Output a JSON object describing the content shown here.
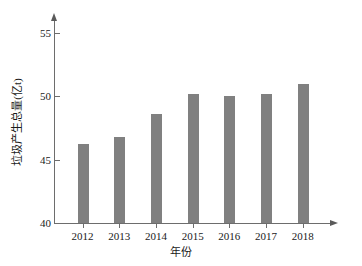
{
  "chart_data": {
    "type": "bar",
    "title": "",
    "subtitle": "",
    "xlabel": "年份",
    "ylabel": "垃圾产生总量(亿t)",
    "categories": [
      "2012",
      "2013",
      "2014",
      "2015",
      "2016",
      "2017",
      "2018"
    ],
    "values": [
      46.2,
      46.8,
      48.6,
      50.2,
      50.0,
      50.2,
      51.0
    ],
    "series": [
      {
        "name": "垃圾产生总量",
        "values": [
          46.2,
          46.8,
          48.6,
          50.2,
          50.0,
          50.2,
          51.0
        ]
      }
    ],
    "ylim": [
      40,
      55
    ],
    "yticks": [
      40,
      45,
      50,
      55
    ],
    "ytick_labels": [
      "40",
      "45",
      "50",
      "55"
    ],
    "xtick_labels": [
      "2012",
      "2013",
      "2014",
      "2015",
      "2016",
      "2017",
      "2018"
    ],
    "grid": false,
    "legend": null,
    "legend_position": "none",
    "bar_color": "#808080",
    "axis_color": "#6d6d6d",
    "background_color": "#ffffff",
    "annotations": []
  }
}
